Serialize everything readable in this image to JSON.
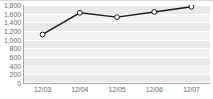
{
  "chart_data": {
    "type": "line",
    "title": "",
    "subtitle": "",
    "xlabel": "",
    "ylabel": "",
    "categories": [
      "12/03",
      "12/04",
      "12/05",
      "12/06",
      "12/07"
    ],
    "values": [
      1120,
      1620,
      1520,
      1640,
      1760
    ],
    "series": [
      {
        "name": "",
        "values": [
          1120,
          1620,
          1520,
          1640,
          1760
        ]
      }
    ],
    "ylim": [
      0,
      1800
    ],
    "ytick_labels": [
      "1,800",
      "1,600",
      "1,400",
      "1,200",
      "1,000",
      "800",
      "600",
      "400",
      "200",
      "0"
    ],
    "ytick_values": [
      1800,
      1600,
      1400,
      1200,
      1000,
      800,
      600,
      400,
      200,
      0
    ],
    "grid": true,
    "legend": "none",
    "marker": "open-circle",
    "colors": {
      "line": "#1a1a1a",
      "marker_fill": "#ffffff",
      "marker_stroke": "#1a1a1a",
      "plot_background": "#f2f2f2",
      "band": "#e9e9e9",
      "gridline": "#ffffff",
      "axis": "#a8a8a8",
      "tick_label": "#6b6b6b"
    }
  }
}
